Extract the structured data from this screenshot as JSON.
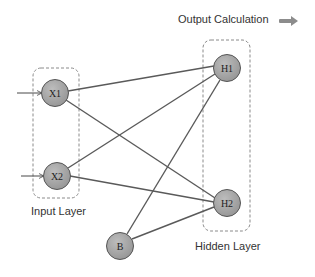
{
  "header": {
    "output_label": "Output Calculation",
    "arrow_icon": "right-arrow-icon"
  },
  "layers": {
    "input": {
      "label": "Input Layer",
      "nodes": [
        "X1",
        "X2"
      ]
    },
    "hidden": {
      "label": "Hidden Layer",
      "nodes": [
        "H1",
        "H2"
      ]
    },
    "bias": {
      "node": "B"
    }
  },
  "edges": [
    [
      "X1",
      "H1"
    ],
    [
      "X1",
      "H2"
    ],
    [
      "X2",
      "H1"
    ],
    [
      "X2",
      "H2"
    ],
    [
      "B",
      "H1"
    ],
    [
      "B",
      "H2"
    ]
  ],
  "colors": {
    "node_fill": "#a6a6a6",
    "node_stroke": "#555555",
    "edge": "#5a5a5a",
    "box": "#8a8a8a",
    "arrow": "#8c8c8c"
  }
}
